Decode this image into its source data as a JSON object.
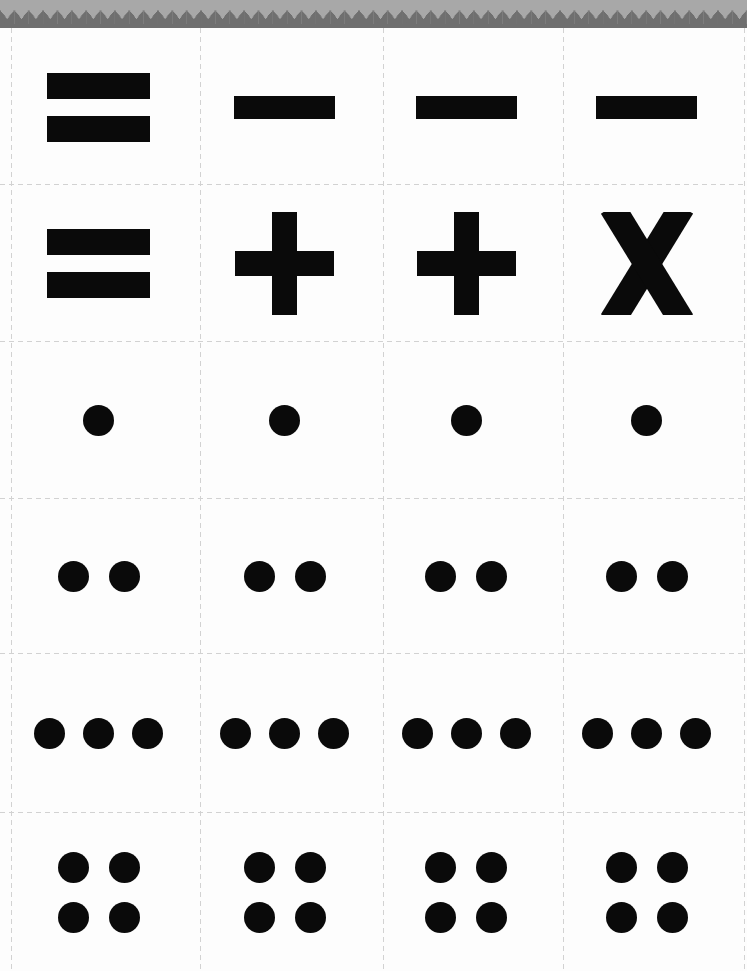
{
  "document": {
    "kind": "printable-cut-out-sheet",
    "visible_text": "",
    "grid": {
      "rows": 6,
      "columns": 4,
      "card_count": 24
    }
  },
  "colors": {
    "page_background": "#fdfdfd",
    "symbol_ink": "#0a0a0a",
    "cut_line": "#d2d2d2",
    "edge_band": "#a8a8a8",
    "edge_teeth": "#6f6f6f"
  },
  "icons": {
    "equals": "equals-sign",
    "minus": "minus-sign",
    "plus": "plus-sign",
    "multiply": "multiplication-x",
    "dots-1": "one-dot",
    "dots-2": "two-dots",
    "dots-3": "three-dots",
    "dots-4": "four-dots"
  },
  "sheet": {
    "rows": [
      {
        "cards": [
          "equals",
          "minus",
          "minus",
          "minus"
        ]
      },
      {
        "cards": [
          "equals",
          "plus",
          "plus",
          "multiply"
        ]
      },
      {
        "cards": [
          "dots-1",
          "dots-1",
          "dots-1",
          "dots-1"
        ]
      },
      {
        "cards": [
          "dots-2",
          "dots-2",
          "dots-2",
          "dots-2"
        ]
      },
      {
        "cards": [
          "dots-3",
          "dots-3",
          "dots-3",
          "dots-3"
        ]
      },
      {
        "cards": [
          "dots-4",
          "dots-4",
          "dots-4",
          "dots-4"
        ]
      }
    ]
  }
}
